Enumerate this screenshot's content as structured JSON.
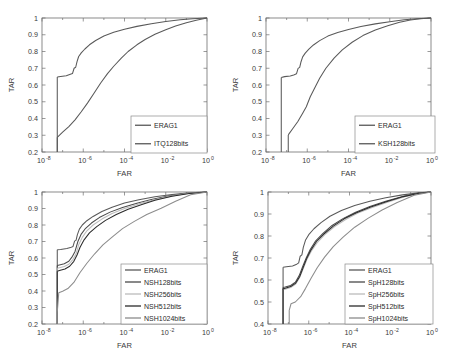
{
  "figure": {
    "type": "multi-panel-roc",
    "panel_count": 4,
    "layout": "2x2 grid",
    "background": "#ffffff",
    "style": "matlab-grayscale"
  },
  "chart_data": [
    {
      "id": "panel-top-left",
      "type": "line",
      "title": "",
      "xlabel": "FAR",
      "ylabel": "TAR",
      "xscale": "log",
      "xlim": [
        1e-08,
        1
      ],
      "ylim": [
        0.2,
        1
      ],
      "xticks": [
        "10-8",
        "10-6",
        "10-4",
        "10-2",
        "100"
      ],
      "xtick_bases": [
        "10",
        "10",
        "10",
        "10",
        "10"
      ],
      "xtick_exps": [
        "-8",
        "-6",
        "-4",
        "-2",
        "0"
      ],
      "yticks": [
        "0.2",
        "0.3",
        "0.4",
        "0.5",
        "0.6",
        "0.7",
        "0.8",
        "0.9",
        "1"
      ],
      "grid": false,
      "legend_position": "lower right",
      "series": [
        {
          "name": "ERAG1",
          "color": "#595959",
          "x": [
            5.5e-08,
            8e-08,
            1.5e-07,
            2.2e-07,
            3e-07,
            3.6e-07,
            4.3e-07,
            5e-07,
            6e-07,
            8e-07,
            1.2e-06,
            2e-06,
            4e-06,
            1e-05,
            3e-05,
            0.0001,
            0.0004,
            0.002,
            0.01,
            0.05,
            0.2,
            1
          ],
          "y": [
            0.648,
            0.651,
            0.655,
            0.662,
            0.668,
            0.7,
            0.706,
            0.74,
            0.77,
            0.792,
            0.815,
            0.84,
            0.866,
            0.893,
            0.915,
            0.933,
            0.95,
            0.966,
            0.979,
            0.989,
            0.996,
            1.0
          ]
        },
        {
          "name": "ITQ128bits",
          "color": "#595959",
          "x": [
            5.5e-08,
            1e-07,
            2e-07,
            4e-07,
            8e-07,
            1.6e-06,
            3.2e-06,
            7e-06,
            1.5e-05,
            3e-05,
            7e-05,
            0.00015,
            0.0004,
            0.001,
            0.003,
            0.01,
            0.03,
            0.1,
            0.3,
            1
          ],
          "y": [
            0.288,
            0.318,
            0.352,
            0.392,
            0.44,
            0.492,
            0.548,
            0.612,
            0.668,
            0.712,
            0.76,
            0.8,
            0.84,
            0.872,
            0.903,
            0.93,
            0.952,
            0.972,
            0.987,
            1.0
          ]
        }
      ]
    },
    {
      "id": "panel-top-right",
      "type": "line",
      "title": "",
      "xlabel": "FAR",
      "ylabel": "TAR",
      "xscale": "log",
      "xlim": [
        1e-08,
        1
      ],
      "ylim": [
        0.2,
        1
      ],
      "xtick_bases": [
        "10",
        "10",
        "10",
        "10",
        "10"
      ],
      "xtick_exps": [
        "-8",
        "-6",
        "-4",
        "-2",
        "0"
      ],
      "yticks": [
        "0.2",
        "0.3",
        "0.4",
        "0.5",
        "0.6",
        "0.7",
        "0.8",
        "0.9",
        "1"
      ],
      "grid": false,
      "legend_position": "lower right",
      "series": [
        {
          "name": "ERAG1",
          "color": "#595959",
          "x": [
            5.5e-08,
            8e-08,
            1.5e-07,
            2.2e-07,
            3e-07,
            3.6e-07,
            4.3e-07,
            5e-07,
            6e-07,
            8e-07,
            1.2e-06,
            2e-06,
            4e-06,
            1e-05,
            3e-05,
            0.0001,
            0.0004,
            0.002,
            0.01,
            0.05,
            0.2,
            1
          ],
          "y": [
            0.645,
            0.65,
            0.654,
            0.66,
            0.667,
            0.699,
            0.705,
            0.739,
            0.768,
            0.79,
            0.814,
            0.839,
            0.865,
            0.892,
            0.914,
            0.932,
            0.949,
            0.965,
            0.978,
            0.989,
            0.996,
            1.0
          ]
        },
        {
          "name": "KSH128bits",
          "color": "#595959",
          "x": [
            1.2e-07,
            2e-07,
            3.5e-07,
            6e-07,
            9e-07,
            1.4e-06,
            2.2e-06,
            4e-06,
            8e-06,
            2e-05,
            5e-05,
            0.00015,
            0.0005,
            0.002,
            0.008,
            0.03,
            0.1,
            0.3,
            1
          ],
          "y": [
            0.302,
            0.34,
            0.382,
            0.432,
            0.47,
            0.53,
            0.578,
            0.64,
            0.7,
            0.76,
            0.81,
            0.855,
            0.895,
            0.928,
            0.954,
            0.974,
            0.988,
            0.995,
            1.0
          ]
        }
      ]
    },
    {
      "id": "panel-bottom-left",
      "type": "line",
      "title": "",
      "xlabel": "FAR",
      "ylabel": "TAR",
      "xscale": "log",
      "xlim": [
        1e-08,
        1
      ],
      "ylim": [
        0.2,
        1
      ],
      "xtick_bases": [
        "10",
        "10",
        "10",
        "10",
        "10"
      ],
      "xtick_exps": [
        "-8",
        "-6",
        "-4",
        "-2",
        "0"
      ],
      "yticks": [
        "0.2",
        "0.3",
        "0.4",
        "0.5",
        "0.6",
        "0.7",
        "0.8",
        "0.9",
        "1"
      ],
      "grid": false,
      "legend_position": "lower right",
      "series": [
        {
          "name": "ERAG1",
          "color": "#595959",
          "x": [
            5.5e-08,
            8e-08,
            1.6e-07,
            2.4e-07,
            3.2e-07,
            3.8e-07,
            4.5e-07,
            5.2e-07,
            6.5e-07,
            9e-07,
            1.5e-06,
            3e-06,
            8e-06,
            2.5e-05,
            0.0001,
            0.0005,
            0.003,
            0.02,
            0.15,
            1
          ],
          "y": [
            0.65,
            0.652,
            0.657,
            0.663,
            0.67,
            0.702,
            0.708,
            0.742,
            0.775,
            0.8,
            0.826,
            0.852,
            0.882,
            0.908,
            0.933,
            0.953,
            0.971,
            0.985,
            0.995,
            1.0
          ]
        },
        {
          "name": "NSH128bits",
          "color": "#4a4a4a",
          "x": [
            5.5e-08,
            7e-08,
            1.2e-07,
            2e-07,
            3e-07,
            4e-07,
            5.5e-07,
            8e-07,
            1.3e-06,
            2.5e-06,
            6e-06,
            2e-05,
            8e-05,
            0.0004,
            0.002,
            0.015,
            0.12,
            1
          ],
          "y": [
            0.555,
            0.558,
            0.565,
            0.58,
            0.61,
            0.64,
            0.7,
            0.745,
            0.78,
            0.812,
            0.845,
            0.878,
            0.906,
            0.932,
            0.955,
            0.977,
            0.993,
            1.0
          ]
        },
        {
          "name": "NSH256bits",
          "color": "#bcbcbc",
          "x": [
            5.5e-08,
            7e-08,
            1.2e-07,
            2e-07,
            3.2e-07,
            4.5e-07,
            6e-07,
            9e-07,
            1.5e-06,
            3e-06,
            8e-06,
            2.5e-05,
            0.0001,
            0.0005,
            0.0025,
            0.018,
            0.13,
            1
          ],
          "y": [
            0.538,
            0.541,
            0.548,
            0.562,
            0.592,
            0.625,
            0.68,
            0.725,
            0.765,
            0.8,
            0.836,
            0.87,
            0.9,
            0.928,
            0.952,
            0.975,
            0.992,
            1.0
          ]
        },
        {
          "name": "NSH512bits",
          "color": "#2a2a2a",
          "x": [
            5.5e-08,
            7e-08,
            1.3e-07,
            2.2e-07,
            3.5e-07,
            5e-07,
            7e-07,
            1.1e-06,
            2e-06,
            4.5e-06,
            1.2e-05,
            4e-05,
            0.00015,
            0.0007,
            0.003,
            0.02,
            0.14,
            1
          ],
          "y": [
            0.52,
            0.524,
            0.533,
            0.55,
            0.58,
            0.618,
            0.665,
            0.71,
            0.752,
            0.79,
            0.828,
            0.864,
            0.896,
            0.924,
            0.95,
            0.974,
            0.991,
            1.0
          ]
        },
        {
          "name": "NSH1024bits",
          "color": "#8c8c8c",
          "x": [
            5.5e-08,
            6.5e-08,
            1e-07,
            1.8e-07,
            3.5e-07,
            7e-07,
            1.5e-06,
            3.5e-06,
            9e-06,
            2.5e-05,
            8e-05,
            0.0003,
            0.0012,
            0.006,
            0.03,
            0.16,
            1
          ],
          "y": [
            0.272,
            0.39,
            0.398,
            0.415,
            0.452,
            0.512,
            0.568,
            0.624,
            0.68,
            0.726,
            0.778,
            0.822,
            0.864,
            0.902,
            0.944,
            0.983,
            1.0
          ]
        }
      ]
    },
    {
      "id": "panel-bottom-right",
      "type": "line",
      "title": "",
      "xlabel": "FAR",
      "ylabel": "TAR",
      "xscale": "log",
      "xlim": [
        1e-08,
        1
      ],
      "ylim": [
        0.4,
        1
      ],
      "xtick_bases": [
        "10",
        "10",
        "10",
        "10",
        "10"
      ],
      "xtick_exps": [
        "-8",
        "-6",
        "-4",
        "-2",
        "0"
      ],
      "yticks": [
        "0.4",
        "0.5",
        "0.6",
        "0.7",
        "0.8",
        "0.9",
        "1"
      ],
      "grid": false,
      "legend_position": "lower right",
      "series": [
        {
          "name": "ERAG1",
          "color": "#595959",
          "x": [
            5.5e-08,
            8e-08,
            1.6e-07,
            2.4e-07,
            3.2e-07,
            3.8e-07,
            4.6e-07,
            5.4e-07,
            7e-07,
            1e-06,
            1.8e-06,
            4e-06,
            1.1e-05,
            4e-05,
            0.00018,
            0.001,
            0.006,
            0.04,
            0.25,
            1
          ],
          "y": [
            0.658,
            0.66,
            0.664,
            0.67,
            0.678,
            0.708,
            0.714,
            0.748,
            0.782,
            0.806,
            0.833,
            0.861,
            0.89,
            0.916,
            0.939,
            0.958,
            0.974,
            0.987,
            0.996,
            1.0
          ]
        },
        {
          "name": "SpH128bits",
          "color": "#4a4a4a",
          "x": [
            5.5e-08,
            7e-08,
            1.3e-07,
            2.2e-07,
            3.4e-07,
            5e-07,
            7.5e-07,
            1.2e-06,
            2.2e-06,
            5e-06,
            1.4e-05,
            5e-05,
            0.0002,
            0.001,
            0.006,
            0.04,
            0.25,
            1
          ],
          "y": [
            0.566,
            0.568,
            0.575,
            0.59,
            0.62,
            0.66,
            0.7,
            0.74,
            0.778,
            0.812,
            0.848,
            0.88,
            0.908,
            0.934,
            0.958,
            0.98,
            0.995,
            1.0
          ]
        },
        {
          "name": "SpH256bits",
          "color": "#bcbcbc",
          "x": [
            5.5e-08,
            7e-08,
            1.3e-07,
            2.3e-07,
            3.6e-07,
            5.4e-07,
            8e-07,
            1.35e-06,
            2.6e-06,
            6e-06,
            1.8e-05,
            6.5e-05,
            0.00026,
            0.0013,
            0.008,
            0.05,
            0.28,
            1
          ],
          "y": [
            0.556,
            0.558,
            0.566,
            0.582,
            0.612,
            0.652,
            0.692,
            0.732,
            0.77,
            0.805,
            0.842,
            0.875,
            0.904,
            0.93,
            0.955,
            0.978,
            0.994,
            1.0
          ]
        },
        {
          "name": "SpH512bits",
          "color": "#2a2a2a",
          "x": [
            5.5e-08,
            7e-08,
            1.3e-07,
            2.3e-07,
            3.6e-07,
            5.3e-07,
            7.8e-07,
            1.3e-06,
            2.4e-06,
            5.5e-06,
            1.6e-05,
            5.5e-05,
            0.00022,
            0.0011,
            0.007,
            0.045,
            0.26,
            1
          ],
          "y": [
            0.56,
            0.562,
            0.57,
            0.586,
            0.616,
            0.656,
            0.696,
            0.737,
            0.775,
            0.809,
            0.845,
            0.878,
            0.906,
            0.932,
            0.957,
            0.979,
            0.994,
            1.0
          ]
        },
        {
          "name": "SpH1024bits",
          "color": "#8c8c8c",
          "x": [
            1.1e-07,
            1.35e-07,
            2.2e-07,
            4e-07,
            7e-07,
            1.3e-06,
            2.6e-06,
            6e-06,
            1.6e-05,
            5e-05,
            0.00018,
            0.0008,
            0.004,
            0.022,
            0.15,
            1
          ],
          "y": [
            0.462,
            0.492,
            0.5,
            0.524,
            0.562,
            0.608,
            0.656,
            0.704,
            0.752,
            0.796,
            0.84,
            0.88,
            0.918,
            0.952,
            0.985,
            1.0
          ]
        }
      ]
    }
  ],
  "panels": {
    "top_left": {
      "xlabel": "FAR",
      "ylabel": "TAR",
      "legend": [
        {
          "label": "ERAG1",
          "color": "#595959"
        },
        {
          "label": "ITQ128bits",
          "color": "#595959"
        }
      ],
      "yticks": [
        "1",
        "0.9",
        "0.8",
        "0.7",
        "0.6",
        "0.5",
        "0.4",
        "0.3",
        "0.2"
      ],
      "xtick_bases": [
        "10",
        "10",
        "10",
        "10",
        "10"
      ],
      "xtick_exps": [
        "-8",
        "-6",
        "-4",
        "-2",
        "0"
      ]
    },
    "top_right": {
      "xlabel": "FAR",
      "ylabel": "TAR",
      "legend": [
        {
          "label": "ERAG1",
          "color": "#595959"
        },
        {
          "label": "KSH128bits",
          "color": "#595959"
        }
      ],
      "yticks": [
        "1",
        "0.9",
        "0.8",
        "0.7",
        "0.6",
        "0.5",
        "0.4",
        "0.3",
        "0.2"
      ],
      "xtick_bases": [
        "10",
        "10",
        "10",
        "10",
        "10"
      ],
      "xtick_exps": [
        "-8",
        "-6",
        "-4",
        "-2",
        "0"
      ]
    },
    "bottom_left": {
      "xlabel": "FAR",
      "ylabel": "TAR",
      "legend": [
        {
          "label": "ERAG1",
          "color": "#595959"
        },
        {
          "label": "NSH128bits",
          "color": "#4a4a4a"
        },
        {
          "label": "NSH256bits",
          "color": "#bcbcbc"
        },
        {
          "label": "NSH512bits",
          "color": "#2a2a2a"
        },
        {
          "label": "NSH1024bits",
          "color": "#8c8c8c"
        }
      ],
      "yticks": [
        "1",
        "0.9",
        "0.8",
        "0.7",
        "0.6",
        "0.5",
        "0.4",
        "0.3",
        "0.2"
      ],
      "xtick_bases": [
        "10",
        "10",
        "10",
        "10",
        "10"
      ],
      "xtick_exps": [
        "-8",
        "-6",
        "-4",
        "-2",
        "0"
      ]
    },
    "bottom_right": {
      "xlabel": "FAR",
      "ylabel": "TAR",
      "legend": [
        {
          "label": "ERAG1",
          "color": "#595959"
        },
        {
          "label": "SpH128bits",
          "color": "#4a4a4a"
        },
        {
          "label": "SpH256bits",
          "color": "#bcbcbc"
        },
        {
          "label": "SpH512bits",
          "color": "#2a2a2a"
        },
        {
          "label": "SpH1024bits",
          "color": "#8c8c8c"
        }
      ],
      "yticks": [
        "1",
        "0.9",
        "0.8",
        "0.7",
        "0.6",
        "0.5",
        "0.4",
        "0.3"
      ],
      "xtick_bases": [
        "10",
        "10",
        "10",
        "10",
        "10"
      ],
      "xtick_exps": [
        "-8",
        "-6",
        "-4",
        "-2",
        "0"
      ]
    }
  }
}
